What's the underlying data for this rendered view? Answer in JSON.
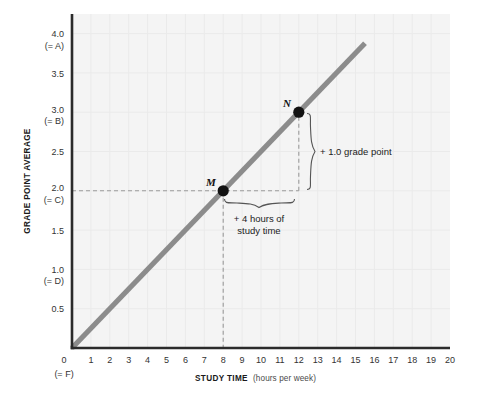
{
  "chart_data": {
    "type": "line",
    "title": "",
    "xlabel": "STUDY TIME",
    "xlabel_sub": "(hours per week)",
    "ylabel": "GRADE POINT AVERAGE",
    "xlim": [
      0,
      20
    ],
    "ylim": [
      0,
      4.25
    ],
    "grid": true,
    "legend": "none",
    "x_ticks": [
      "0",
      "1",
      "2",
      "3",
      "4",
      "5",
      "6",
      "7",
      "8",
      "9",
      "10",
      "11",
      "12",
      "13",
      "14",
      "15",
      "16",
      "17",
      "18",
      "19",
      "20"
    ],
    "x_tick_values": [
      0,
      1,
      2,
      3,
      4,
      5,
      6,
      7,
      8,
      9,
      10,
      11,
      12,
      13,
      14,
      15,
      16,
      17,
      18,
      19,
      20
    ],
    "x_origin_sublabel": "(= F)",
    "y_ticks": [
      {
        "value": 0.5,
        "label": "0.5",
        "sub": ""
      },
      {
        "value": 1.0,
        "label": "1.0",
        "sub": "(= D)"
      },
      {
        "value": 1.5,
        "label": "1.5",
        "sub": ""
      },
      {
        "value": 2.0,
        "label": "2.0",
        "sub": "(= C)"
      },
      {
        "value": 2.5,
        "label": "2.5",
        "sub": ""
      },
      {
        "value": 3.0,
        "label": "3.0",
        "sub": "(= B)"
      },
      {
        "value": 3.5,
        "label": "3.5",
        "sub": ""
      },
      {
        "value": 4.0,
        "label": "4.0",
        "sub": "(= A)"
      }
    ],
    "series": [
      {
        "name": "study-time-vs-gpa",
        "color": "#8c8c8c",
        "x": [
          0,
          15.5
        ],
        "values": [
          0,
          3.875
        ],
        "slope": 0.25,
        "intercept": 0
      }
    ],
    "points": [
      {
        "label": "M",
        "x": 8,
        "y": 2.0
      },
      {
        "label": "N",
        "x": 12,
        "y": 3.0
      }
    ],
    "annotations": [
      {
        "name": "rise",
        "text": "+ 1.0 grade point",
        "from_y": 2.0,
        "to_y": 3.0,
        "at_x": 12
      },
      {
        "name": "run",
        "text_line1": "+ 4 hours of",
        "text_line2": "study time",
        "from_x": 8,
        "to_x": 12,
        "at_y": 2.0
      }
    ],
    "guides": [
      {
        "name": "horizontal-guide-gpa-2",
        "orientation": "horizontal",
        "y": 2.0,
        "from_x": 0,
        "to_x": 12
      },
      {
        "name": "vertical-guide-hours-8",
        "orientation": "vertical",
        "x": 8,
        "from_y": 0,
        "to_y": 2.0
      },
      {
        "name": "vertical-guide-hours-12",
        "orientation": "vertical",
        "x": 12,
        "from_y": 2.0,
        "to_y": 3.0
      }
    ]
  },
  "colors": {
    "plot_background": "#f4f4f4",
    "line": "#8c8c8c",
    "axis": "#2b2b2b",
    "grid": "#e8e8e8",
    "dash": "#9a9a9a",
    "point": "#121212",
    "text": "#222222",
    "page_background": "#ffffff"
  }
}
